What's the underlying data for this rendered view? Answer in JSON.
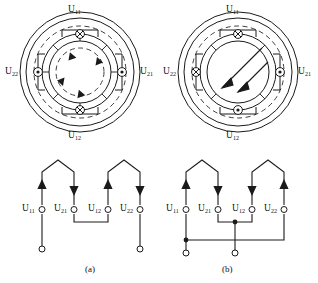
{
  "figure": {
    "type": "electrical-machine-winding-diagram",
    "caption_a": "(a)",
    "caption_b": "(b)"
  },
  "stator_a": {
    "name": "stator-cross-section-a",
    "field_type": "circulating-loop",
    "labels": {
      "top": "U",
      "top_sub": "11",
      "right": "U",
      "right_sub": "21",
      "bottom": "U",
      "bottom_sub": "12",
      "left": "U",
      "left_sub": "22"
    },
    "conductor_markers": [
      {
        "position": "top",
        "symbol": "cross"
      },
      {
        "position": "right",
        "symbol": "dot"
      },
      {
        "position": "bottom",
        "symbol": "cross"
      },
      {
        "position": "left",
        "symbol": "dot"
      }
    ]
  },
  "stator_b": {
    "name": "stator-cross-section-b",
    "field_type": "two-pole-diagonal",
    "labels": {
      "top": "U",
      "top_sub": "11",
      "right": "U",
      "right_sub": "21",
      "bottom": "U",
      "bottom_sub": "12",
      "left": "U",
      "left_sub": "22"
    },
    "conductor_markers": [
      {
        "position": "top",
        "symbol": "cross"
      },
      {
        "position": "right",
        "symbol": "dot"
      },
      {
        "position": "bottom",
        "symbol": "dot"
      },
      {
        "position": "left",
        "symbol": "cross"
      }
    ]
  },
  "circuit_a": {
    "name": "winding-connection-a",
    "terminals": [
      {
        "label": "U",
        "sub": "11",
        "arrow": "up"
      },
      {
        "label": "U",
        "sub": "21",
        "arrow": "down"
      },
      {
        "label": "U",
        "sub": "12",
        "arrow": "up"
      },
      {
        "label": "U",
        "sub": "22",
        "arrow": "down"
      }
    ],
    "link": "U21-to-U12",
    "open_terminals": [
      "U11-lead",
      "U22-lead"
    ]
  },
  "circuit_b": {
    "name": "winding-connection-b",
    "terminals": [
      {
        "label": "U",
        "sub": "11",
        "arrow": "up"
      },
      {
        "label": "U",
        "sub": "21",
        "arrow": "down"
      },
      {
        "label": "U",
        "sub": "12",
        "arrow": "down"
      },
      {
        "label": "U",
        "sub": "22",
        "arrow": "up"
      }
    ],
    "link": "U21-to-U12-bridged-with-bus",
    "open_terminals": [
      "U11-lead",
      "center-lead"
    ]
  },
  "colors": {
    "line": "#1a1a1a",
    "dashed": "#2a2a2a",
    "background": "#ffffff"
  }
}
